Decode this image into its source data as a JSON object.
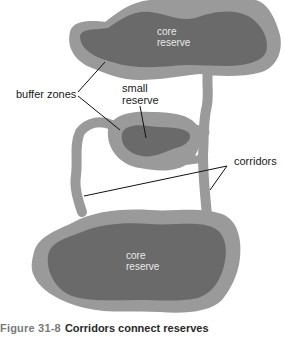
{
  "figure": {
    "number_label": "Figure 31-8",
    "title": "Corridors connect reserves"
  },
  "labels": {
    "top_core": [
      "core",
      "reserve"
    ],
    "small_reserve_label": [
      "small",
      "reserve"
    ],
    "small_reserve": {
      "line1": "small",
      "line2": "reserve"
    },
    "top_core_text": {
      "line1": "core",
      "line2": "reserve"
    },
    "bottom_core_text": {
      "line1": "core",
      "line2": "reserve"
    },
    "buffer_zones": "buffer zones",
    "corridors": "corridors"
  },
  "colors": {
    "buffer": "#9a9a9a",
    "core": "#6a6a6a",
    "leader_line": "#111111",
    "caption_number": "#7a7a7a",
    "caption_title": "#2a2a2a",
    "background": "#ffffff"
  }
}
